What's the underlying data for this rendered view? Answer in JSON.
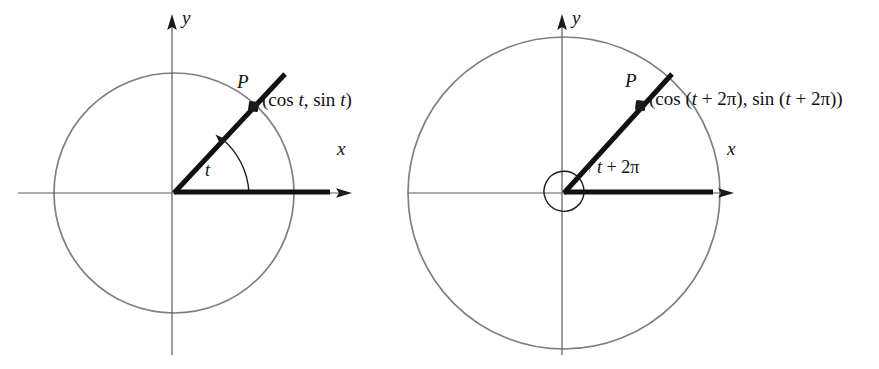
{
  "figure": {
    "type": "math-diagram",
    "background_color": "#ffffff",
    "colors": {
      "circle_stroke": "#808080",
      "axis_stroke": "#5a5a5a",
      "ray_stroke": "#111111",
      "text": "#111111"
    }
  },
  "panels": [
    {
      "id": "left",
      "name": "angle-t-panel",
      "origin": {
        "x": 174,
        "y": 193
      },
      "circle_radius": 120,
      "axis_labels": {
        "x": "x",
        "y": "y"
      },
      "point_label": "P",
      "coordinate_label": "(cos t, sin t)",
      "coordinate_parts": {
        "open": "(cos ",
        "var1": "t",
        "mid": ", sin ",
        "var2": "t",
        "close": ")"
      },
      "angle_label": "t",
      "angle_degrees": 49,
      "has_spiral": false
    },
    {
      "id": "right",
      "name": "angle-t-plus-2pi-panel",
      "origin": {
        "x": 564,
        "y": 193
      },
      "circle_radius": 156,
      "axis_labels": {
        "x": "x",
        "y": "y"
      },
      "point_label": "P",
      "coordinate_label": "(cos (t + 2π), sin (t + 2π))",
      "coordinate_parts": {
        "open": "(cos (",
        "var1": "t",
        "plus1": " + 2π), sin (",
        "var2": "t",
        "close": " + 2π))"
      },
      "angle_label": "t + 2π",
      "angle_label_parts": {
        "var": "t",
        "rest": " + 2π"
      },
      "angle_degrees": 49,
      "has_spiral": true,
      "spiral_radius": 20
    }
  ]
}
